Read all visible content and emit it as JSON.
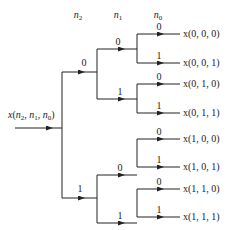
{
  "diagram": {
    "headers": [
      "n2",
      "n1",
      "n0"
    ],
    "input_label": "x(n2, n1, n0)",
    "level_n2": [
      {
        "bit": "0"
      },
      {
        "bit": "1"
      }
    ],
    "level_n1": [
      {
        "bit": "0"
      },
      {
        "bit": "1"
      },
      {
        "bit": "0"
      },
      {
        "bit": "1"
      }
    ],
    "level_n0": [
      {
        "bit": "0"
      },
      {
        "bit": "1"
      },
      {
        "bit": "0"
      },
      {
        "bit": "1"
      },
      {
        "bit": "0"
      },
      {
        "bit": "1"
      },
      {
        "bit": "0"
      },
      {
        "bit": "1"
      }
    ],
    "outputs": [
      "x(0, 0, 0)",
      "x(0, 0, 1)",
      "x(0, 1, 0)",
      "x(0, 1, 1)",
      "x(1, 0, 0)",
      "x(1, 0, 1)",
      "x(1, 1, 0)",
      "x(1, 1, 1)"
    ],
    "line_color": "#222222"
  }
}
